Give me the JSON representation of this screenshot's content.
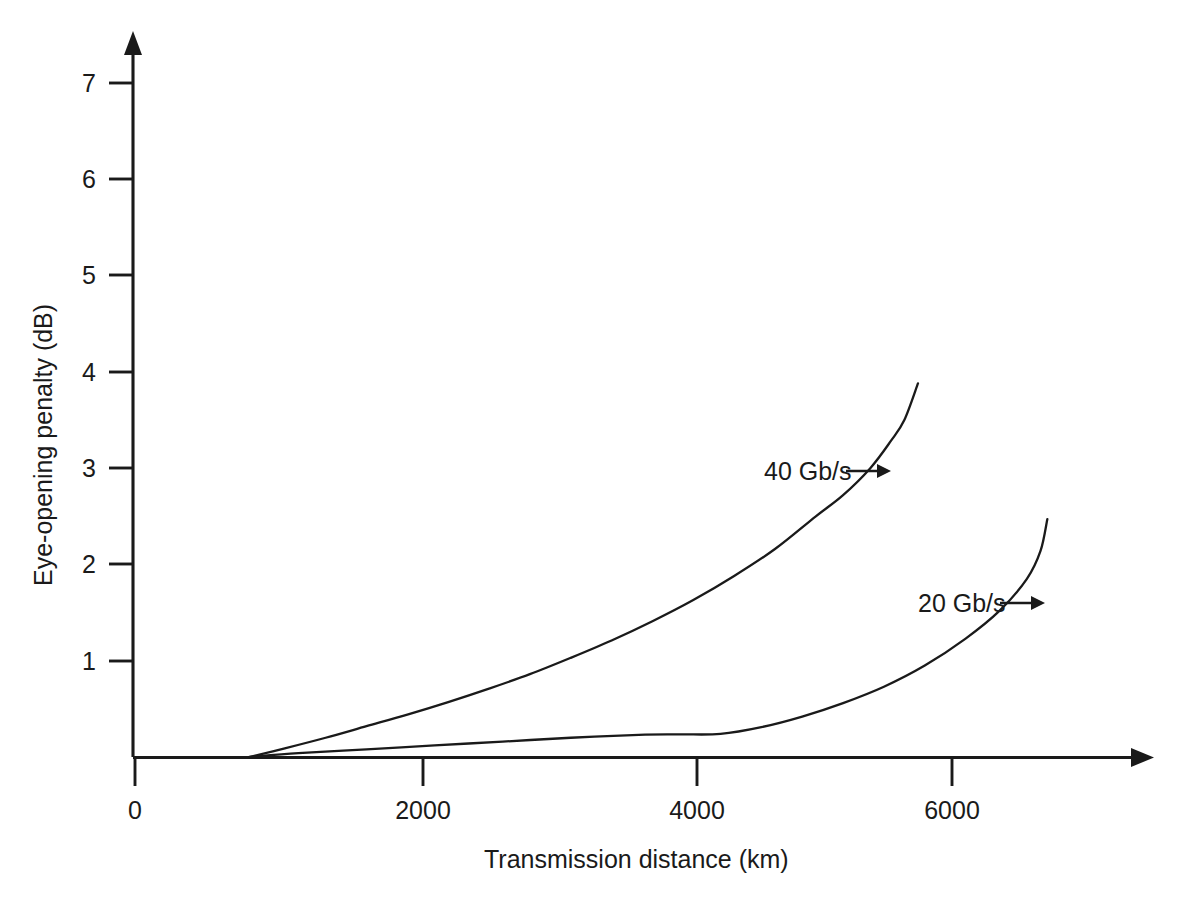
{
  "chart_data": {
    "type": "line",
    "title": "",
    "xlabel": "Transmission distance (km)",
    "ylabel": "Eye-opening penalty (dB)",
    "xlim": [
      0,
      7450
    ],
    "ylim": [
      0,
      7.45
    ],
    "xticks": [
      0,
      2000,
      4000,
      6000
    ],
    "xtick_labels": [
      "0",
      "2000",
      "4000",
      "6000"
    ],
    "yticks": [
      1,
      2,
      3,
      4,
      5,
      6,
      7
    ],
    "ytick_labels": [
      "1",
      "2",
      "3",
      "4",
      "5",
      "6",
      "7"
    ],
    "grid": false,
    "legend_position": "inline-annotations",
    "axis_style": "arrow-terminated-open-axes",
    "line_color": "#1a1a1a",
    "background_color": "#ffffff",
    "series": [
      {
        "name": "40 Gb/s",
        "label": "40 Gb/s",
        "annotation_text": "40 Gb/s",
        "x": [
          840,
          1100,
          1400,
          1700,
          2000,
          2300,
          2600,
          2900,
          3200,
          3500,
          3800,
          4100,
          4400,
          4700,
          5000,
          5200,
          5400,
          5550,
          5650,
          5750
        ],
        "y": [
          0.0,
          0.09,
          0.2,
          0.32,
          0.44,
          0.57,
          0.71,
          0.86,
          1.03,
          1.21,
          1.41,
          1.63,
          1.88,
          2.16,
          2.5,
          2.72,
          3.0,
          3.28,
          3.5,
          3.88
        ]
      },
      {
        "name": "20 Gb/s",
        "label": "20 Gb/s",
        "annotation_text": "20 Gb/s",
        "x": [
          840,
          1200,
          1700,
          2200,
          2700,
          3200,
          3700,
          4000,
          4300,
          4600,
          4900,
          5200,
          5500,
          5800,
          6100,
          6350,
          6550,
          6650,
          6700
        ],
        "y": [
          0.0,
          0.04,
          0.08,
          0.12,
          0.16,
          0.2,
          0.23,
          0.235,
          0.24,
          0.31,
          0.42,
          0.56,
          0.73,
          0.95,
          1.23,
          1.52,
          1.85,
          2.14,
          2.47
        ]
      }
    ],
    "annotations": [
      {
        "text": "40 Gb/s",
        "arrow": "right",
        "points_to_series": "40 Gb/s"
      },
      {
        "text": "20 Gb/s",
        "arrow": "right",
        "points_to_series": "20 Gb/s"
      }
    ]
  },
  "axes": {
    "x_title": "Transmission distance (km)",
    "y_title": "Eye-opening penalty (dB)",
    "x_tick_labels": [
      "0",
      "2000",
      "4000",
      "6000"
    ],
    "y_tick_labels": [
      "7",
      "6",
      "5",
      "4",
      "3",
      "2",
      "1"
    ]
  }
}
